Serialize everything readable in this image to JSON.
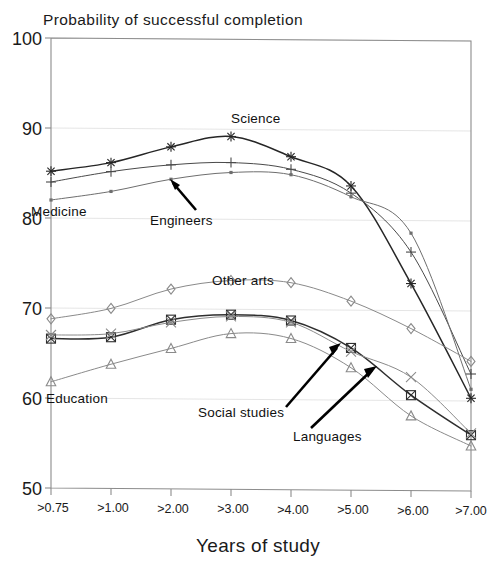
{
  "chart_data": {
    "type": "line",
    "title": "Probability of successful completion",
    "xlabel": "Years of study",
    "ylabel": "",
    "xlim": [
      0,
      7
    ],
    "ylim": [
      50,
      100
    ],
    "grid": true,
    "legend_position": "inline-annotations",
    "x_tick_labels": [
      ">0.75",
      ">1.00",
      ">2.00",
      ">3.00",
      ">4.00",
      ">5.00",
      ">6.00",
      ">7.00"
    ],
    "y_tick_labels": [
      "100",
      "90",
      "80",
      "70",
      "60",
      "50"
    ],
    "y_ticks": [
      100,
      90,
      80,
      70,
      60,
      50
    ],
    "x": [
      0,
      1,
      2,
      3,
      4,
      5,
      6,
      7
    ],
    "series": [
      {
        "name": "Science",
        "marker": "asterisk",
        "color": "#262626",
        "values": [
          85.2,
          86.2,
          88.0,
          89.2,
          87.0,
          83.8,
          73.0,
          60.3
        ]
      },
      {
        "name": "Engineers",
        "marker": "plus",
        "color": "#4a4a4a",
        "values": [
          84.0,
          85.2,
          86.0,
          86.3,
          85.6,
          83.0,
          76.5,
          63.0
        ]
      },
      {
        "name": "Medicine",
        "marker": "dot",
        "color": "#6e6e6e",
        "values": [
          82.0,
          83.0,
          84.4,
          85.2,
          85.0,
          82.6,
          78.6,
          61.3
        ]
      },
      {
        "name": "Other arts",
        "marker": "diamond",
        "color": "#8a8a8a",
        "values": [
          68.8,
          70.0,
          72.2,
          73.2,
          73.0,
          71.0,
          68.0,
          64.4
        ]
      },
      {
        "name": "Social studies",
        "marker": "boxed-x",
        "color": "#2e2e2e",
        "values": [
          66.6,
          66.8,
          68.8,
          69.4,
          68.8,
          65.8,
          60.6,
          56.2
        ]
      },
      {
        "name": "Languages",
        "marker": "cross",
        "color": "#8a8a8a",
        "values": [
          67.0,
          67.2,
          68.5,
          69.2,
          68.6,
          65.4,
          62.6,
          56.4
        ]
      },
      {
        "name": "Education",
        "marker": "triangle",
        "color": "#8a8a8a",
        "values": [
          61.8,
          63.8,
          65.6,
          67.3,
          66.8,
          63.6,
          58.3,
          55.0
        ]
      }
    ],
    "annotations": [
      {
        "text": "Science",
        "series": "Science",
        "type": "label"
      },
      {
        "text": "Engineers",
        "series": "Engineers",
        "type": "arrow-label"
      },
      {
        "text": "Medicine",
        "series": "Medicine",
        "type": "label"
      },
      {
        "text": "Other arts",
        "series": "Other arts",
        "type": "label"
      },
      {
        "text": "Social studies",
        "series": "Social studies",
        "type": "arrow-label"
      },
      {
        "text": "Languages",
        "series": "Languages",
        "type": "arrow-label"
      },
      {
        "text": "Education",
        "series": "Education",
        "type": "label"
      }
    ]
  },
  "labels": {
    "title": "Probability of successful completion",
    "xaxis_title": "Years of study",
    "science": "Science",
    "engineers": "Engineers",
    "medicine": "Medicine",
    "other_arts": "Other arts",
    "social_studies": "Social studies",
    "languages": "Languages",
    "education": "Education"
  },
  "ytick": {
    "t100": "100",
    "t90": "90",
    "t80": "80",
    "t70": "70",
    "t60": "60",
    "t50": "50"
  },
  "xtick": {
    "t0": ">0.75",
    "t1": ">1.00",
    "t2": ">2.00",
    "t3": ">3.00",
    "t4": ">4.00",
    "t5": ">5.00",
    "t6": ">6.00",
    "t7": ">7.00"
  }
}
